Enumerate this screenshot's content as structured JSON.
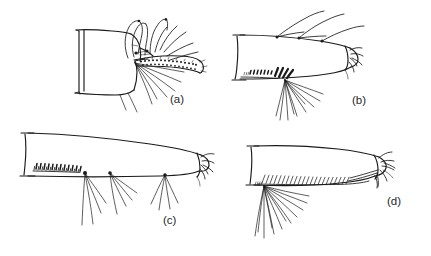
{
  "figure": {
    "kind": "scientific-line-drawing",
    "background_color": "#ffffff",
    "ink_color": "#1a1a1a",
    "width": 431,
    "height": 256,
    "panels": [
      {
        "id": "a",
        "label": "(a)",
        "label_x": 170,
        "label_y": 103,
        "description": "segment with siphon, comb scales, pecten and long ventral hair tufts"
      },
      {
        "id": "b",
        "label": "(b)",
        "label_x": 352,
        "label_y": 104,
        "description": "elongate siphon with dorsal hairs, pecten row and ventral hair fan"
      },
      {
        "id": "c",
        "label": "(c)",
        "label_x": 163,
        "label_y": 224,
        "description": "long tapering siphon with pecten teeth and three ventral hair tufts"
      },
      {
        "id": "d",
        "label": "(d)",
        "label_x": 387,
        "label_y": 205,
        "description": "long siphon with dense ventral pecten comb and large basal hair fan"
      }
    ],
    "labels": [
      "(a)",
      "(b)",
      "(c)",
      "(d)"
    ]
  }
}
